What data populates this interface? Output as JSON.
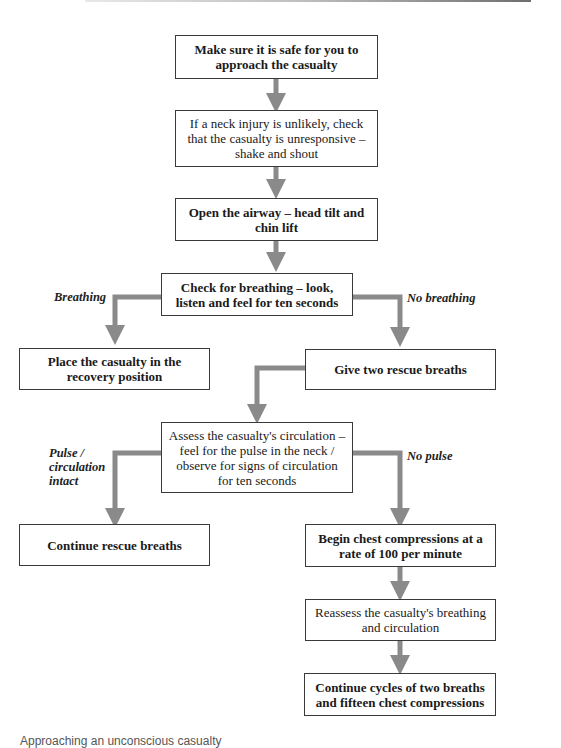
{
  "diagram": {
    "type": "flowchart",
    "arrow_color": "#8a8a8a",
    "nodes": {
      "safe": "Make sure it is safe for you to approach the casualty",
      "responsive": "If a neck injury is unlikely, check that the casualty is unresponsive – shake and shout",
      "airway": "Open the airway – head tilt and chin lift",
      "check_breathing": "Check for breathing – look, listen and feel for ten seconds",
      "recovery": "Place the casualty in the recovery position",
      "rescue_breaths": "Give two rescue breaths",
      "assess_circulation": "Assess the casualty's circulation – feel for the pulse in the neck / observe for signs of circulation for ten seconds",
      "continue_breaths": "Continue rescue breaths",
      "compressions": "Begin chest compressions at a rate of 100 per minute",
      "reassess": "Reassess the casualty's breathing and circulation",
      "continue_cycles": "Continue cycles of two breaths and fifteen chest compressions"
    },
    "branch_labels": {
      "breathing": "Breathing",
      "no_breathing": "No breathing",
      "pulse_intact": "Pulse / circulation intact",
      "no_pulse": "No pulse"
    }
  },
  "footer": {
    "partial_text": "Approaching an unconscious casualty"
  }
}
